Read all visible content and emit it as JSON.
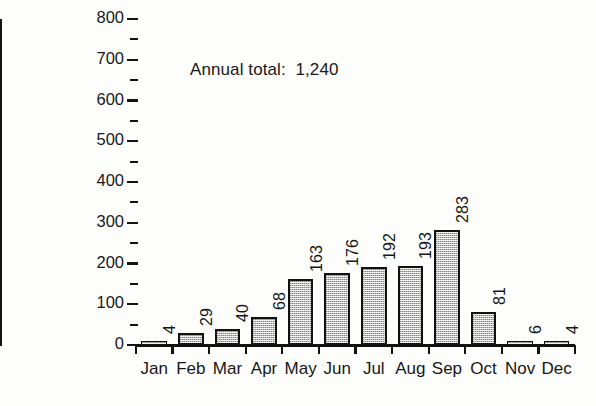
{
  "chart_data": {
    "type": "bar",
    "title": "",
    "subtitle": "",
    "xlabel": "",
    "ylabel": "Rainfall (mm)",
    "categories": [
      "Jan",
      "Feb",
      "Mar",
      "Apr",
      "May",
      "Jun",
      "Jul",
      "Aug",
      "Sep",
      "Oct",
      "Nov",
      "Dec"
    ],
    "values": [
      4,
      29,
      40,
      68,
      163,
      176,
      192,
      193,
      283,
      81,
      6,
      4
    ],
    "value_labels": [
      "4",
      "29",
      "40",
      "68",
      "163",
      "176",
      "192",
      "193",
      "283",
      "81",
      "6",
      "4"
    ],
    "ylim": [
      0,
      800
    ],
    "ytick_values": [
      0,
      100,
      200,
      300,
      400,
      500,
      600,
      700,
      800
    ],
    "ytick_labels": [
      "0",
      "100",
      "200",
      "300",
      "400",
      "500",
      "600",
      "700",
      "800"
    ],
    "yminor_values": [
      50,
      150,
      250,
      350,
      450,
      550,
      650,
      750
    ],
    "grid": false,
    "legend": false,
    "legend_position": "none",
    "annotations": [
      {
        "text": "Annual total:  1,240",
        "label": "Annual total:",
        "value": "1,240"
      }
    ],
    "bar_fill_color": "#b9b9b9",
    "bar_edge_color": "#111111",
    "axis_color": "#121212",
    "background_color": "#fdfdfb"
  }
}
